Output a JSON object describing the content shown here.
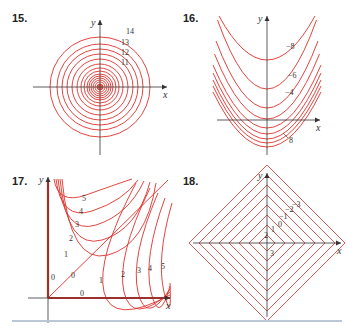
{
  "header_fragment": "graph of the function",
  "panels": [
    {
      "number": "15.",
      "xlabel": "x",
      "ylabel": "y"
    },
    {
      "number": "16.",
      "xlabel": "x",
      "ylabel": "y"
    },
    {
      "number": "17.",
      "xlabel": "x",
      "ylabel": "y"
    },
    {
      "number": "18.",
      "xlabel": "x",
      "ylabel": "y"
    }
  ],
  "colors": {
    "contour": "#e0302a",
    "axis": "#333333",
    "rule": "#b9c7d6"
  },
  "chart_data": [
    {
      "type": "contour",
      "title": "15.",
      "description": "Concentric circles centered at origin, levels increasing outward",
      "labeled_levels": [
        11,
        12,
        13,
        14
      ],
      "radii_px": [
        3,
        5,
        7,
        9,
        11,
        13,
        16,
        19,
        23,
        28,
        33,
        38,
        43,
        50
      ],
      "xlabel": "x",
      "ylabel": "y"
    },
    {
      "type": "contour",
      "title": "16.",
      "description": "Nested upward parabolas; levels -8 top to 8 bottom",
      "labeled_levels": [
        -8,
        -6,
        -4,
        8
      ],
      "vertex_y_px": [
        60,
        89,
        108,
        119,
        128,
        134,
        139,
        143,
        147
      ],
      "xlabel": "x",
      "ylabel": "y"
    },
    {
      "type": "contour",
      "title": "17.",
      "description": "Hyperbola-like curves in first quadrant; 0 along axes and diagonal y=x",
      "labeled_levels": [
        0,
        1,
        2,
        3,
        4,
        5
      ],
      "xlabel": "x",
      "ylabel": "y"
    },
    {
      "type": "contour",
      "title": "18.",
      "description": "Nested diamonds (|x|+|y| = c); levels 3 innermost to -3 outermost",
      "labeled_levels": [
        3,
        2,
        1,
        0,
        -1,
        -2,
        -3
      ],
      "half_diagonals_px": [
        8,
        18,
        28,
        38,
        48,
        58,
        68,
        78
      ],
      "xlabel": "x",
      "ylabel": "y"
    }
  ]
}
